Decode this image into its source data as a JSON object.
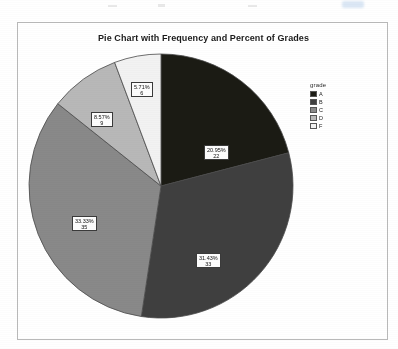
{
  "chart_data": {
    "type": "pie",
    "title": "Pie Chart with Frequency and Percent of Grades",
    "legend_title": "grade",
    "legend_position": "right",
    "total": 105,
    "categories": [
      "A",
      "B",
      "C",
      "D",
      "F"
    ],
    "values": [
      22,
      33,
      35,
      9,
      6
    ],
    "percents": [
      "20.95%",
      "31.43%",
      "33.33%",
      "8.57%",
      "5.71%"
    ],
    "colors": [
      "#1b1b14",
      "#3f3f3f",
      "#898989",
      "#b8b8b8",
      "#f2f2f2"
    ],
    "labels": [
      {
        "pct": "20.95%",
        "count": "22"
      },
      {
        "pct": "31.43%",
        "count": "33"
      },
      {
        "pct": "33.33%",
        "count": "35"
      },
      {
        "pct": "8.57%",
        "count": "9"
      },
      {
        "pct": "5.71%",
        "count": "6"
      }
    ],
    "xlabel": "",
    "ylabel": "",
    "grid": false
  },
  "legend": {
    "title": "grade",
    "items": [
      {
        "label": "A",
        "color": "#1b1b14"
      },
      {
        "label": "B",
        "color": "#3f3f3f"
      },
      {
        "label": "C",
        "color": "#898989"
      },
      {
        "label": "D",
        "color": "#b8b8b8"
      },
      {
        "label": "F",
        "color": "#f2f2f2"
      }
    ]
  },
  "chart": {
    "title": "Pie Chart with Frequency and Percent of Grades"
  }
}
